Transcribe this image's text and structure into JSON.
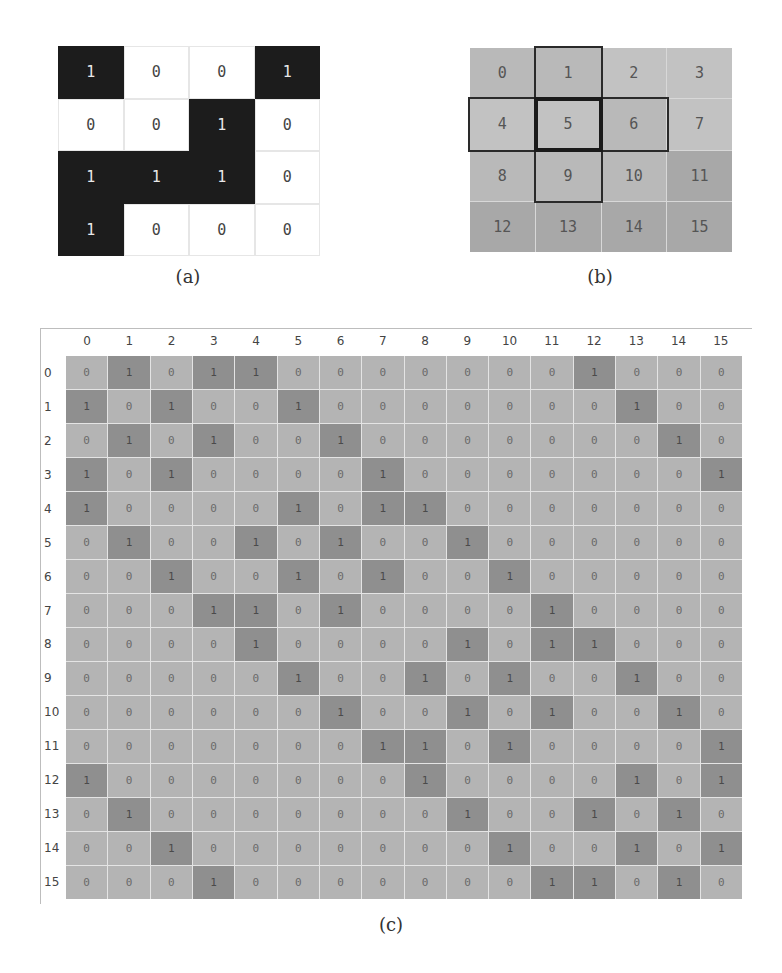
{
  "panel_a": {
    "caption": "(a)",
    "rows": [
      [
        "1",
        "0",
        "0",
        "1"
      ],
      [
        "0",
        "0",
        "1",
        "0"
      ],
      [
        "1",
        "1",
        "1",
        "0"
      ],
      [
        "1",
        "0",
        "0",
        "0"
      ]
    ]
  },
  "panel_b": {
    "caption": "(b)",
    "rows": [
      [
        "0",
        "1",
        "2",
        "3"
      ],
      [
        "4",
        "5",
        "6",
        "7"
      ],
      [
        "8",
        "9",
        "10",
        "11"
      ],
      [
        "12",
        "13",
        "14",
        "15"
      ]
    ],
    "center_cell": "5",
    "neighbor_cells": [
      "1",
      "4",
      "6",
      "9"
    ]
  },
  "panel_c": {
    "caption": "(c)",
    "column_headers": [
      "0",
      "1",
      "2",
      "3",
      "4",
      "5",
      "6",
      "7",
      "8",
      "9",
      "10",
      "11",
      "12",
      "13",
      "14",
      "15"
    ],
    "row_headers": [
      "0",
      "1",
      "2",
      "3",
      "4",
      "5",
      "6",
      "7",
      "8",
      "9",
      "10",
      "11",
      "12",
      "13",
      "14",
      "15"
    ],
    "matrix": [
      [
        "0",
        "1",
        "0",
        "1",
        "1",
        "0",
        "0",
        "0",
        "0",
        "0",
        "0",
        "0",
        "1",
        "0",
        "0",
        "0"
      ],
      [
        "1",
        "0",
        "1",
        "0",
        "0",
        "1",
        "0",
        "0",
        "0",
        "0",
        "0",
        "0",
        "0",
        "1",
        "0",
        "0"
      ],
      [
        "0",
        "1",
        "0",
        "1",
        "0",
        "0",
        "1",
        "0",
        "0",
        "0",
        "0",
        "0",
        "0",
        "0",
        "1",
        "0"
      ],
      [
        "1",
        "0",
        "1",
        "0",
        "0",
        "0",
        "0",
        "1",
        "0",
        "0",
        "0",
        "0",
        "0",
        "0",
        "0",
        "1"
      ],
      [
        "1",
        "0",
        "0",
        "0",
        "0",
        "1",
        "0",
        "1",
        "1",
        "0",
        "0",
        "0",
        "0",
        "0",
        "0",
        "0"
      ],
      [
        "0",
        "1",
        "0",
        "0",
        "1",
        "0",
        "1",
        "0",
        "0",
        "1",
        "0",
        "0",
        "0",
        "0",
        "0",
        "0"
      ],
      [
        "0",
        "0",
        "1",
        "0",
        "0",
        "1",
        "0",
        "1",
        "0",
        "0",
        "1",
        "0",
        "0",
        "0",
        "0",
        "0"
      ],
      [
        "0",
        "0",
        "0",
        "1",
        "1",
        "0",
        "1",
        "0",
        "0",
        "0",
        "0",
        "1",
        "0",
        "0",
        "0",
        "0"
      ],
      [
        "0",
        "0",
        "0",
        "0",
        "1",
        "0",
        "0",
        "0",
        "0",
        "1",
        "0",
        "1",
        "1",
        "0",
        "0",
        "0"
      ],
      [
        "0",
        "0",
        "0",
        "0",
        "0",
        "1",
        "0",
        "0",
        "1",
        "0",
        "1",
        "0",
        "0",
        "1",
        "0",
        "0"
      ],
      [
        "0",
        "0",
        "0",
        "0",
        "0",
        "0",
        "1",
        "0",
        "0",
        "1",
        "0",
        "1",
        "0",
        "0",
        "1",
        "0"
      ],
      [
        "0",
        "0",
        "0",
        "0",
        "0",
        "0",
        "0",
        "1",
        "1",
        "0",
        "1",
        "0",
        "0",
        "0",
        "0",
        "1"
      ],
      [
        "1",
        "0",
        "0",
        "0",
        "0",
        "0",
        "0",
        "0",
        "1",
        "0",
        "0",
        "0",
        "0",
        "1",
        "0",
        "1"
      ],
      [
        "0",
        "1",
        "0",
        "0",
        "0",
        "0",
        "0",
        "0",
        "0",
        "1",
        "0",
        "0",
        "1",
        "0",
        "1",
        "0"
      ],
      [
        "0",
        "0",
        "1",
        "0",
        "0",
        "0",
        "0",
        "0",
        "0",
        "0",
        "1",
        "0",
        "0",
        "1",
        "0",
        "1"
      ],
      [
        "0",
        "0",
        "0",
        "1",
        "0",
        "0",
        "0",
        "0",
        "0",
        "0",
        "0",
        "1",
        "1",
        "0",
        "1",
        "0"
      ]
    ]
  },
  "colors": {
    "binary_on": "#1c1c1c",
    "binary_off": "#ffffff",
    "index_cell": "#b9b9b9",
    "matrix_cell": "#b4b4b4",
    "matrix_on": "#8f8f8f",
    "highlight_border": "#2a2a2a"
  }
}
